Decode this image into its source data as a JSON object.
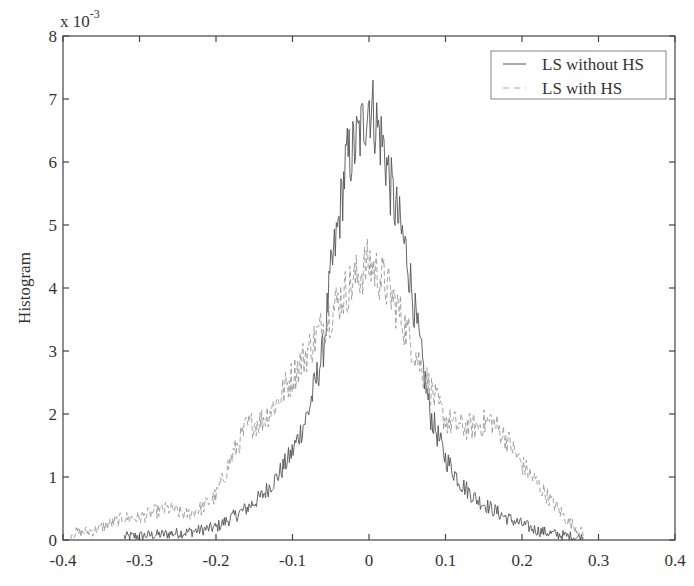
{
  "chart_data": {
    "type": "line",
    "title": "",
    "xlabel": "",
    "ylabel": "Histogram",
    "y_multiplier_label": "x 10",
    "y_multiplier_exp": "-3",
    "xlim": [
      -0.4,
      0.4
    ],
    "ylim": [
      0,
      8
    ],
    "xticks": [
      -0.4,
      -0.3,
      -0.2,
      -0.1,
      0,
      0.1,
      0.2,
      0.3,
      0.4
    ],
    "xtick_labels": [
      "-0.4",
      "-0.3",
      "-0.2",
      "-0.1",
      "0",
      "0.1",
      "0.2",
      "0.3",
      "0.4"
    ],
    "yticks": [
      0,
      1,
      2,
      3,
      4,
      5,
      6,
      7,
      8
    ],
    "ytick_labels": [
      "0",
      "1",
      "2",
      "3",
      "4",
      "5",
      "6",
      "7",
      "8"
    ],
    "grid": false,
    "legend_position": "upper right",
    "series": [
      {
        "name": "LS without HS",
        "style": "solid",
        "color": "#555555",
        "x": [
          -0.32,
          -0.28,
          -0.24,
          -0.2,
          -0.18,
          -0.16,
          -0.14,
          -0.12,
          -0.1,
          -0.08,
          -0.06,
          -0.05,
          -0.04,
          -0.03,
          -0.02,
          -0.01,
          0,
          0.01,
          0.02,
          0.03,
          0.04,
          0.05,
          0.06,
          0.07,
          0.08,
          0.1,
          0.12,
          0.14,
          0.16,
          0.18,
          0.2,
          0.22,
          0.24,
          0.26,
          0.28
        ],
        "y": [
          0.05,
          0.08,
          0.12,
          0.2,
          0.35,
          0.5,
          0.7,
          1.0,
          1.4,
          2.0,
          3.0,
          4.2,
          5.0,
          6.0,
          6.2,
          6.5,
          7.0,
          6.6,
          6.2,
          5.5,
          5.0,
          4.5,
          3.6,
          2.8,
          2.0,
          1.3,
          0.9,
          0.65,
          0.5,
          0.35,
          0.25,
          0.15,
          0.1,
          0.06,
          0.03
        ]
      },
      {
        "name": "LS with HS",
        "style": "dashed",
        "color": "#999999",
        "x": [
          -0.39,
          -0.36,
          -0.34,
          -0.32,
          -0.3,
          -0.28,
          -0.26,
          -0.24,
          -0.22,
          -0.2,
          -0.18,
          -0.16,
          -0.14,
          -0.12,
          -0.1,
          -0.08,
          -0.06,
          -0.04,
          -0.02,
          0,
          0.02,
          0.04,
          0.06,
          0.08,
          0.1,
          0.12,
          0.14,
          0.16,
          0.18,
          0.2,
          0.22,
          0.24,
          0.26,
          0.28
        ],
        "y": [
          0.1,
          0.15,
          0.25,
          0.35,
          0.35,
          0.45,
          0.5,
          0.4,
          0.5,
          0.7,
          1.3,
          1.8,
          1.9,
          2.2,
          2.6,
          3.0,
          3.4,
          3.8,
          4.1,
          4.4,
          4.1,
          3.6,
          3.0,
          2.4,
          1.9,
          1.8,
          1.8,
          1.9,
          1.6,
          1.2,
          0.9,
          0.6,
          0.3,
          0.1
        ]
      }
    ]
  },
  "legend": {
    "items": [
      {
        "label": "LS without HS",
        "style": "solid"
      },
      {
        "label": "LS with HS",
        "style": "dashed"
      }
    ]
  }
}
